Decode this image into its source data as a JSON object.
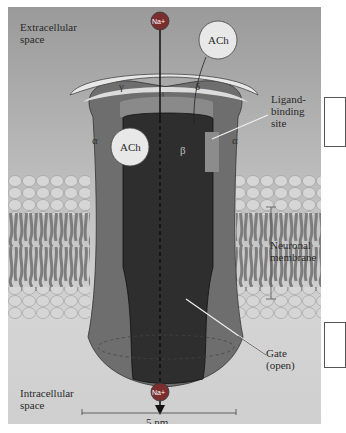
{
  "figure": {
    "labels": {
      "extracellular_line1": "Extracellular",
      "extracellular_line2": "space",
      "intracellular_line1": "Intracellular",
      "intracellular_line2": "space",
      "ligand_line1": "Ligand-",
      "ligand_line2": "binding",
      "ligand_line3": "site",
      "membrane_line1": "Neuronal",
      "membrane_line2": "membrane",
      "gate_line1": "Gate",
      "gate_line2": "(open)",
      "scale": "5 nm"
    },
    "ions": {
      "top": "Na+",
      "bottom": "Na+"
    },
    "molecules": {
      "ach_free": "ACh",
      "ach_bound": "ACh"
    },
    "subunits": {
      "gamma": "γ",
      "delta": "δ",
      "alpha_left": "α",
      "alpha_right": "α",
      "beta": "β"
    },
    "colors": {
      "background_top": "#9a9a9a",
      "background_bottom": "#d4d4d4",
      "alpha_subunit": "#6e6e6e",
      "pore_core": "#2e2e2e",
      "ring_light": "#e6e6e6",
      "lipid_head": "#d9d9d9",
      "lipid_tail": "#7a7a7a",
      "ion": "#7a2e2e"
    }
  }
}
